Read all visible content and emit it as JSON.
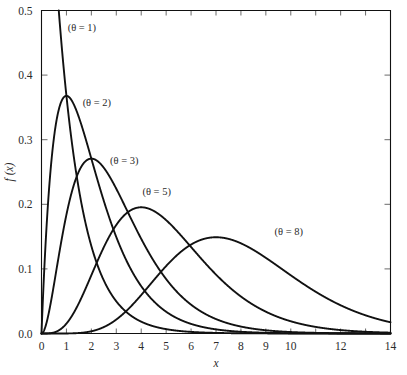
{
  "chart_data": {
    "type": "line",
    "title": "",
    "subtitle": "",
    "xlabel": "x",
    "ylabel": "f (x)",
    "xlim": [
      0,
      14
    ],
    "ylim": [
      0,
      0.5
    ],
    "grid": false,
    "legend_position": "inline-annotations",
    "x_ticks": [
      0,
      1,
      2,
      3,
      4,
      5,
      6,
      7,
      8,
      9,
      10,
      11,
      12,
      13,
      14
    ],
    "x_tick_labels": [
      "0",
      "1",
      "2",
      "3",
      "4",
      "5",
      "6",
      "7",
      "8",
      "9",
      "10",
      "",
      "12",
      "",
      "14"
    ],
    "y_ticks": [
      0.0,
      0.1,
      0.2,
      0.3,
      0.4,
      0.5
    ],
    "y_tick_labels": [
      "0.0",
      "0.1",
      "0.2",
      "0.3",
      "0.4",
      "0.5"
    ],
    "series": [
      {
        "name": "(θ = 1)",
        "theta": 1,
        "label": "(θ = 1)",
        "label_x": 1.05,
        "label_y": 0.468,
        "peak_x": 0.0,
        "peak_y": 1.0,
        "x": [
          0,
          0.25,
          0.5,
          0.75,
          1,
          1.25,
          1.5,
          1.75,
          2,
          2.5,
          3,
          3.5,
          4,
          5,
          6,
          7,
          8,
          9,
          10,
          11,
          12,
          13,
          14
        ],
        "y": [
          1.0,
          0.7788,
          0.6065,
          0.4724,
          0.3679,
          0.2865,
          0.2231,
          0.1738,
          0.1353,
          0.0821,
          0.0498,
          0.0302,
          0.0183,
          0.0067,
          0.0025,
          0.0009,
          0.0003,
          0.0001,
          0.0,
          0.0,
          0.0,
          0.0,
          0.0
        ]
      },
      {
        "name": "(θ = 2)",
        "theta": 2,
        "label": "(θ = 2)",
        "label_x": 1.65,
        "label_y": 0.352,
        "peak_x": 1.0,
        "peak_y": 0.3679,
        "x": [
          0,
          0.25,
          0.5,
          0.75,
          1,
          1.25,
          1.5,
          1.75,
          2,
          2.5,
          3,
          3.5,
          4,
          4.5,
          5,
          6,
          7,
          8,
          9,
          10,
          11,
          12,
          13,
          14
        ],
        "y": [
          0.0,
          0.1947,
          0.3033,
          0.3543,
          0.3679,
          0.3581,
          0.3347,
          0.3041,
          0.2707,
          0.2052,
          0.1494,
          0.1057,
          0.0733,
          0.05,
          0.0337,
          0.0149,
          0.0064,
          0.0027,
          0.0011,
          0.0005,
          0.0002,
          0.0001,
          0.0,
          0.0
        ]
      },
      {
        "name": "(θ = 3)",
        "theta": 3,
        "label": "(θ = 3)",
        "label_x": 2.75,
        "label_y": 0.262,
        "peak_x": 2.0,
        "peak_y": 0.2707,
        "x": [
          0,
          0.5,
          1,
          1.5,
          2,
          2.5,
          3,
          3.5,
          4,
          4.5,
          5,
          5.5,
          6,
          7,
          8,
          9,
          10,
          11,
          12,
          13,
          14
        ],
        "y": [
          0.0,
          0.0758,
          0.1839,
          0.251,
          0.2707,
          0.2565,
          0.224,
          0.1851,
          0.1465,
          0.1125,
          0.0842,
          0.0618,
          0.0446,
          0.0223,
          0.0107,
          0.005,
          0.0023,
          0.001,
          0.0004,
          0.0002,
          0.0001
        ]
      },
      {
        "name": "(θ = 5)",
        "theta": 5,
        "label": "(θ = 5)",
        "label_x": 4.05,
        "label_y": 0.214,
        "peak_x": 4.0,
        "peak_y": 0.1954,
        "x": [
          0,
          0.5,
          1,
          1.5,
          2,
          2.5,
          3,
          3.5,
          4,
          4.5,
          5,
          5.5,
          6,
          6.5,
          7,
          8,
          9,
          10,
          11,
          12,
          13,
          14
        ],
        "y": [
          0.0,
          0.0016,
          0.0153,
          0.0471,
          0.0902,
          0.1336,
          0.168,
          0.1888,
          0.1954,
          0.1898,
          0.1755,
          0.1558,
          0.1339,
          0.1118,
          0.0912,
          0.0573,
          0.0337,
          0.0189,
          0.0102,
          0.0053,
          0.0027,
          0.0014
        ]
      },
      {
        "name": "(θ = 8)",
        "theta": 8,
        "label": "(θ = 8)",
        "label_x": 9.35,
        "label_y": 0.152,
        "peak_x": 7.0,
        "peak_y": 0.149,
        "x": [
          0,
          1,
          2,
          2.5,
          3,
          3.5,
          4,
          4.5,
          5,
          5.5,
          6,
          6.5,
          7,
          7.5,
          8,
          8.5,
          9,
          9.5,
          10,
          11,
          12,
          13,
          14
        ],
        "y": [
          0.0,
          0.0001,
          0.0034,
          0.0084,
          0.0163,
          0.0264,
          0.0383,
          0.0508,
          0.0653,
          0.0771,
          0.0882,
          0.0972,
          0.149,
          0.1383,
          0.1396,
          0.129,
          0.1171,
          0.1044,
          0.0913,
          0.0663,
          0.0452,
          0.0292,
          0.018
        ]
      }
    ]
  },
  "axes": {
    "x_label": "x",
    "y_label": "f (x)"
  }
}
